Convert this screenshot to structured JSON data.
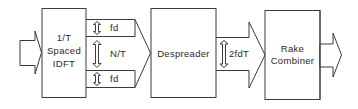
{
  "diagram": {
    "type": "block-diagram",
    "blocks": [
      {
        "id": "idft",
        "lines": [
          "1/T",
          "Spaced",
          "IDFT"
        ]
      },
      {
        "id": "despreader",
        "lines": [
          "Despreader"
        ]
      },
      {
        "id": "rake",
        "lines": [
          "Rake",
          "Combiner"
        ]
      }
    ],
    "annotations": {
      "top_band": "fd",
      "middle": "N/T",
      "bottom_band": "fd",
      "despreader_output": "2fdT"
    },
    "connections": [
      {
        "from": "input",
        "to": "idft"
      },
      {
        "from": "idft",
        "to": "despreader"
      },
      {
        "from": "despreader",
        "to": "rake"
      },
      {
        "from": "rake",
        "to": "output"
      }
    ]
  }
}
